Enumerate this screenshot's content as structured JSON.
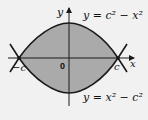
{
  "diagram": {
    "axes": {
      "x_label": "x",
      "y_label": "y",
      "origin_label": "0"
    },
    "points": {
      "left": "−c",
      "right": "c"
    },
    "curves": {
      "upper": "y = c² − x²",
      "lower": "y = x² − c²"
    },
    "colors": {
      "fill": "#aaaaaa",
      "stroke": "#1a1a1a",
      "background": "#f1f1f1"
    }
  }
}
